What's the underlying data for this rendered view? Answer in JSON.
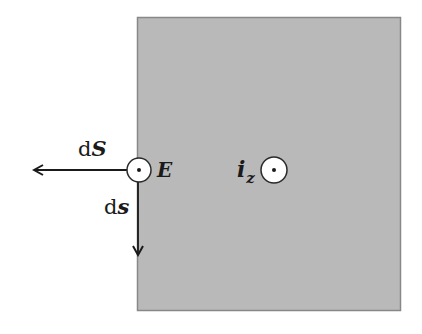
{
  "diagram": {
    "region": {
      "fill": "#b9b9b9",
      "stroke": "#888888"
    },
    "labels": {
      "dS": {
        "prefix": "d",
        "vector": "S"
      },
      "ds": {
        "prefix": "d",
        "vector": "s"
      },
      "E": {
        "vector": "E"
      },
      "iz": {
        "vector": "i",
        "subscript": "z"
      }
    },
    "symbols": {
      "E_point": "out-of-page (dot in circle)",
      "iz_point": "out-of-page (dot in circle)"
    },
    "colors": {
      "ink": "#1a1a1a",
      "circle_fill": "#ffffff"
    }
  }
}
